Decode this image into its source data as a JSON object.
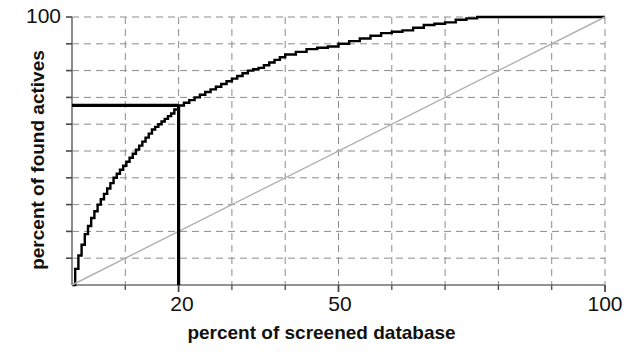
{
  "chart_data": {
    "type": "line",
    "title": "",
    "xlabel": "percent of screened database",
    "ylabel": "percent of found actives",
    "xlim": [
      0,
      100
    ],
    "ylim": [
      0,
      100
    ],
    "grid": true,
    "grid_style": "dashed",
    "legend": "none",
    "x_tick_labels": [
      "20",
      "50",
      "100"
    ],
    "x_tick_values": [
      20,
      50,
      100
    ],
    "x_minor_tick_values": [
      10,
      20,
      30,
      40,
      50,
      60,
      70,
      80,
      90,
      100
    ],
    "y_tick_labels": [
      "100"
    ],
    "y_tick_values": [
      100
    ],
    "y_gridline_values": [
      10,
      20,
      30,
      40,
      50,
      60,
      70,
      80,
      90,
      100
    ],
    "series": [
      {
        "name": "enrichment curve",
        "color": "#000000",
        "style": "staircase",
        "x": [
          0,
          0.6,
          1.2,
          1.8,
          2.4,
          3.0,
          3.6,
          4.2,
          4.8,
          5.4,
          6.0,
          6.6,
          7.2,
          7.8,
          8.4,
          9.0,
          9.6,
          10.2,
          10.8,
          11.4,
          12.0,
          12.6,
          13.2,
          13.8,
          14.4,
          15.0,
          15.6,
          16.2,
          16.8,
          17.4,
          18.0,
          18.6,
          19.2,
          20.0,
          21.0,
          22.0,
          23.0,
          24.0,
          25.0,
          26.0,
          27.0,
          28.0,
          29.0,
          30.0,
          31.0,
          32.0,
          33.0,
          34.0,
          35.0,
          36.0,
          37.0,
          38.0,
          39.0,
          40.0,
          42.0,
          44.0,
          46.0,
          48.0,
          50.0,
          52.0,
          54.0,
          56.0,
          58.0,
          60.0,
          62.0,
          64.0,
          66.0,
          68.0,
          70.0,
          72.0,
          74.0,
          76.0,
          100.0
        ],
        "y": [
          0,
          6,
          11,
          15,
          19,
          22,
          25,
          27.5,
          30,
          32,
          34,
          36,
          38,
          40,
          41.5,
          43,
          44.5,
          46,
          47.5,
          49,
          50.5,
          52,
          53.5,
          55,
          56.5,
          58,
          59,
          60,
          61,
          62,
          63,
          64,
          65.5,
          67,
          68,
          69,
          70,
          71,
          72,
          73,
          74,
          75,
          76,
          77,
          78,
          79,
          80,
          80.5,
          81,
          82,
          83,
          84,
          85,
          86,
          87,
          88,
          88.5,
          89,
          90,
          91,
          92,
          93,
          94,
          94.5,
          95,
          96,
          97,
          97.5,
          98,
          99,
          99.5,
          100,
          100
        ]
      },
      {
        "name": "random reference line",
        "color": "#b0b0b0",
        "style": "solid",
        "x": [
          0,
          100
        ],
        "y": [
          0,
          100
        ]
      }
    ],
    "annotations": [
      {
        "name": "vertical-marker",
        "type": "vline",
        "x": 20,
        "y_from": 0,
        "y_to": 67,
        "color": "#000000"
      },
      {
        "name": "horizontal-marker",
        "type": "hline",
        "y": 67,
        "x_from": 0,
        "x_to": 20,
        "color": "#000000"
      }
    ]
  },
  "axes": {
    "y_label": "percent of found actives",
    "x_label": "percent of screened database",
    "y_top_label": "100",
    "x_labels": {
      "twenty": "20",
      "fifty": "50",
      "hundred": "100"
    }
  }
}
